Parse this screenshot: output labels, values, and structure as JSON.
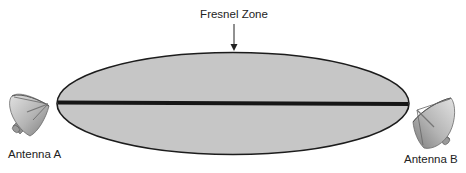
{
  "diagram": {
    "title_label": "Fresnel Zone",
    "antenna_a_label": "Antenna A",
    "antenna_b_label": "Antenna B",
    "colors": {
      "zone_fill": "#c6c6c6",
      "zone_stroke": "#1c1c1c",
      "line_of_sight": "#161616",
      "dish_light": "#d6d6d6",
      "dish_dark": "#8a8a8a",
      "text": "#222222"
    }
  }
}
